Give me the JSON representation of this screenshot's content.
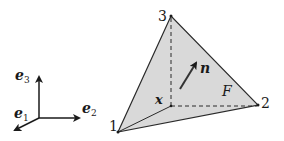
{
  "diagram": {
    "type": "tetrahedron-face",
    "colors": {
      "face_fill": "#d9d9d9",
      "stroke": "#2a2a2a",
      "background": "#ffffff"
    },
    "vertices": [
      {
        "id": "1",
        "label": "1"
      },
      {
        "id": "2",
        "label": "2"
      },
      {
        "id": "3",
        "label": "3"
      },
      {
        "id": "x",
        "label": "x"
      }
    ],
    "face_label": "F",
    "normal_label": "n",
    "axes": {
      "e1": {
        "base": "e",
        "sub": "1"
      },
      "e2": {
        "base": "e",
        "sub": "2"
      },
      "e3": {
        "base": "e",
        "sub": "3"
      }
    }
  }
}
